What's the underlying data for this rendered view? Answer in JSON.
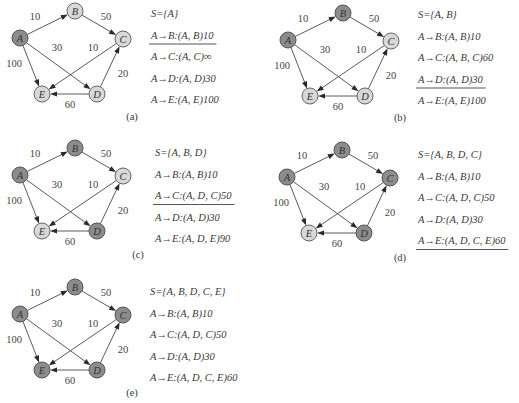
{
  "figure": {
    "colors": {
      "visited_node": "#8c8c8c",
      "unvisited_node": "#d8d8d8",
      "edge": "#5a5a5a"
    },
    "nodes": [
      "A",
      "B",
      "C",
      "D",
      "E"
    ],
    "edges": [
      {
        "from": "A",
        "to": "B",
        "weight": "10"
      },
      {
        "from": "B",
        "to": "C",
        "weight": "50"
      },
      {
        "from": "A",
        "to": "D",
        "weight": "30"
      },
      {
        "from": "A",
        "to": "E",
        "weight": "100"
      },
      {
        "from": "C",
        "to": "E",
        "weight": "10"
      },
      {
        "from": "D",
        "to": "C",
        "weight": "20"
      },
      {
        "from": "D",
        "to": "E",
        "weight": "60"
      }
    ],
    "panels": [
      {
        "caption": "(a)",
        "visited": [
          "A"
        ],
        "lines": [
          "S={A}",
          "A→B:(A, B)10",
          "A→C:(A, C)∞",
          "A→D:(A, D)30",
          "A→E:(A, E)100"
        ],
        "underline_index": 1
      },
      {
        "caption": "(b)",
        "visited": [
          "A",
          "B"
        ],
        "lines": [
          "S={A, B}",
          "A→B:(A, B)10",
          "A→C:(A, B, C)60",
          "A→D:(A, D)30",
          "A→E:(A, E)100"
        ],
        "underline_index": 3
      },
      {
        "caption": "(c)",
        "visited": [
          "A",
          "B",
          "D"
        ],
        "lines": [
          "S={A, B, D}",
          "A→B:(A, B)10",
          "A→C:(A, D, C)50",
          "A→D:(A, D)30",
          "A→E:(A, D, E)90"
        ],
        "underline_index": 2
      },
      {
        "caption": "(d)",
        "visited": [
          "A",
          "B",
          "D",
          "C"
        ],
        "lines": [
          "S={A, B, D, C}",
          "A→B:(A, B)10",
          "A→C:(A, D, C)50",
          "A→D:(A, D)30",
          "A→E:(A, D, C, E)60"
        ],
        "underline_index": 4
      },
      {
        "caption": "(e)",
        "visited": [
          "A",
          "B",
          "D",
          "C",
          "E"
        ],
        "lines": [
          "S={A, B, D, C, E}",
          "A→B:(A, B)10",
          "A→C:(A, D, C)50",
          "A→D:(A, D)30",
          "A→E:(A, D, C, E)60"
        ],
        "underline_index": null
      }
    ]
  }
}
